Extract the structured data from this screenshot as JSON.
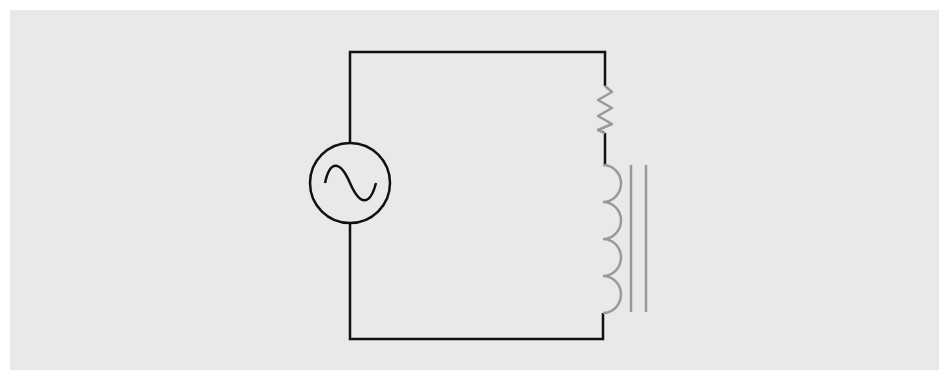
{
  "diagram": {
    "background_color": "#e9e9e9",
    "wire_color": "#111111",
    "component_color": "#999999",
    "components": [
      {
        "id": "ac-source",
        "type": "AC voltage source",
        "symbol": "sine-wave-in-circle"
      },
      {
        "id": "resistor",
        "type": "resistor",
        "symbol": "zigzag"
      },
      {
        "id": "inductor",
        "type": "iron-core inductor",
        "turns": 4,
        "core_lines": 2
      }
    ],
    "connections": [
      "ac-source",
      "resistor",
      "inductor",
      "ac-source"
    ]
  }
}
